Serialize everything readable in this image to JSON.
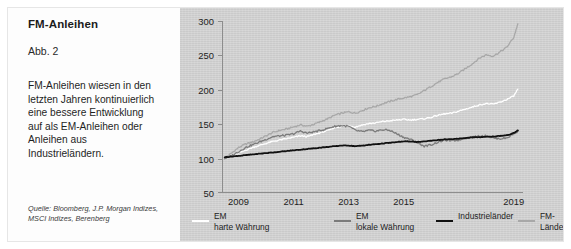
{
  "figure": {
    "title": "FM-Anleihen",
    "number": "Abb. 2",
    "description": "FM-Anleihen wiesen in den letzten Jahren kontinuierlich eine bessere Entwicklung auf als EM-Anleihen oder Anleihen aus Industrieländern.",
    "source": "Quelle: Bloomberg, J.P. Morgan Indizes, MSCI Indizes, Berenberg"
  },
  "colors": {
    "panel_background": "#cfcfcf",
    "text_panel_background": "#fdfdfd",
    "axis": "#8d8d8d",
    "em_hard_currency": "#ffffff",
    "em_local_currency": "#7b7b7b",
    "developed_markets": "#111111",
    "frontier_markets": "#a8a8a8"
  },
  "legend": {
    "items": [
      {
        "label": "EM\nharte Währung",
        "color": "#ffffff",
        "name": "em-harte-waehrung"
      },
      {
        "label": "EM\nlokale Währung",
        "color": "#7b7b7b",
        "name": "em-lokale-waehrung"
      },
      {
        "label": "Industrieländer",
        "color": "#111111",
        "name": "industrielaender"
      },
      {
        "label": "FM-Länder",
        "color": "#a8a8a8",
        "name": "fm-laender"
      }
    ]
  },
  "chart_data": {
    "type": "line",
    "title": "FM-Anleihen",
    "xlabel": "",
    "ylabel": "",
    "grid": false,
    "legend_position": "bottom",
    "ylim": [
      50,
      300
    ],
    "yticks": [
      50,
      100,
      150,
      200,
      250,
      300
    ],
    "xlim": [
      2008.4,
      2019.3
    ],
    "xticks": [
      2009,
      2011,
      2013,
      2015,
      2019
    ],
    "xtick_labels": [
      "2009",
      "2011",
      "2013",
      "2015",
      "2019"
    ],
    "x": [
      2008.5,
      2008.75,
      2009,
      2009.25,
      2009.5,
      2009.75,
      2010,
      2010.25,
      2010.5,
      2010.75,
      2011,
      2011.25,
      2011.5,
      2011.75,
      2012,
      2012.25,
      2012.5,
      2012.75,
      2013,
      2013.25,
      2013.5,
      2013.75,
      2014,
      2014.25,
      2014.5,
      2014.75,
      2015,
      2015.25,
      2015.5,
      2015.75,
      2016,
      2016.25,
      2016.5,
      2016.75,
      2017,
      2017.25,
      2017.5,
      2017.75,
      2018,
      2018.25,
      2018.5,
      2018.75,
      2019,
      2019.15
    ],
    "series": [
      {
        "name": "FM-Länder",
        "color": "#a8a8a8",
        "values": [
          101,
          108,
          116,
          121,
          124,
          128,
          133,
          138,
          141,
          143,
          146,
          149,
          147,
          150,
          154,
          158,
          163,
          166,
          168,
          166,
          170,
          174,
          176,
          180,
          183,
          186,
          188,
          190,
          193,
          199,
          205,
          211,
          216,
          219,
          224,
          231,
          238,
          246,
          251,
          249,
          255,
          262,
          276,
          296
        ]
      },
      {
        "name": "EM harte Währung",
        "color": "#ffffff",
        "values": [
          100,
          103,
          108,
          112,
          116,
          119,
          122,
          125,
          127,
          129,
          131,
          133,
          132,
          135,
          138,
          141,
          145,
          147,
          148,
          146,
          149,
          151,
          152,
          154,
          155,
          156,
          157,
          156,
          157,
          158,
          160,
          163,
          165,
          166,
          169,
          172,
          175,
          178,
          180,
          179,
          182,
          186,
          191,
          201
        ]
      },
      {
        "name": "EM lokale Währung",
        "color": "#7b7b7b",
        "values": [
          100,
          104,
          110,
          116,
          120,
          124,
          128,
          132,
          133,
          134,
          136,
          140,
          137,
          139,
          141,
          144,
          147,
          148,
          147,
          141,
          139,
          141,
          140,
          142,
          141,
          136,
          131,
          128,
          123,
          118,
          120,
          124,
          127,
          126,
          127,
          130,
          131,
          133,
          133,
          130,
          129,
          130,
          136,
          140
        ]
      },
      {
        "name": "Industrieländer",
        "color": "#111111",
        "values": [
          102,
          103,
          104,
          105,
          106,
          107,
          108,
          109,
          110,
          111,
          112,
          113,
          114,
          115,
          116,
          117,
          118,
          119,
          119,
          118,
          119,
          120,
          121,
          122,
          123,
          124,
          125,
          125,
          124,
          125,
          126,
          127,
          128,
          128,
          129,
          130,
          131,
          131,
          132,
          132,
          133,
          134,
          137,
          141
        ]
      }
    ]
  }
}
